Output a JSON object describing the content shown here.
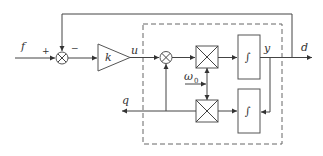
{
  "diagram": {
    "type": "block-diagram",
    "labels": {
      "input": "f",
      "plus": "+",
      "minus": "−",
      "gain": "k",
      "control": "u",
      "frequency": "ω",
      "frequency_sub": "0",
      "output_y": "y",
      "output_d": "d",
      "output_q": "q",
      "integrator": "∫"
    },
    "blocks": [
      {
        "id": "sum1",
        "kind": "summing-junction"
      },
      {
        "id": "gain",
        "kind": "gain",
        "label": "k"
      },
      {
        "id": "sum2",
        "kind": "summing-junction"
      },
      {
        "id": "mult1",
        "kind": "multiplier"
      },
      {
        "id": "mult2",
        "kind": "multiplier"
      },
      {
        "id": "int1",
        "kind": "integrator"
      },
      {
        "id": "int2",
        "kind": "integrator"
      }
    ],
    "colors": {
      "line": "#444444",
      "background": "#ffffff"
    }
  }
}
